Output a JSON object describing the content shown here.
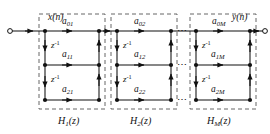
{
  "diagram": {
    "title_absent": "",
    "input_label": "x(n)",
    "output_label": "y(n)",
    "delay_label_base": "z",
    "delay_label_exp": "-1",
    "ellipsis": "⋯",
    "colors": {
      "line": "#111111",
      "dashed_box": "#555555",
      "node": "#111111",
      "background": "#ffffff",
      "text": "#111111"
    },
    "sections": [
      {
        "name": "H",
        "name_sub": "1",
        "name_suffix": "(z)",
        "label": "H1(z)",
        "coefficients": [
          {
            "base": "a",
            "sub": "01",
            "label": "a01"
          },
          {
            "base": "a",
            "sub": "11",
            "label": "a11"
          },
          {
            "base": "a",
            "sub": "21",
            "label": "a21"
          }
        ],
        "delays": [
          "z-1",
          "z-1"
        ]
      },
      {
        "name": "H",
        "name_sub": "2",
        "name_suffix": "(z)",
        "label": "H2(z)",
        "coefficients": [
          {
            "base": "a",
            "sub": "02",
            "label": "a02"
          },
          {
            "base": "a",
            "sub": "12",
            "label": "a12"
          },
          {
            "base": "a",
            "sub": "22",
            "label": "a22"
          }
        ],
        "delays": [
          "z-1",
          "z-1"
        ]
      },
      {
        "name": "H",
        "name_sub": "M",
        "name_suffix": "(z)",
        "label": "HM(z)",
        "coefficients": [
          {
            "base": "a",
            "sub": "0M",
            "label": "a0M"
          },
          {
            "base": "a",
            "sub": "1M",
            "label": "a1M"
          },
          {
            "base": "a",
            "sub": "2M",
            "label": "a2M"
          }
        ],
        "delays": [
          "z-1",
          "z-1"
        ]
      }
    ]
  }
}
